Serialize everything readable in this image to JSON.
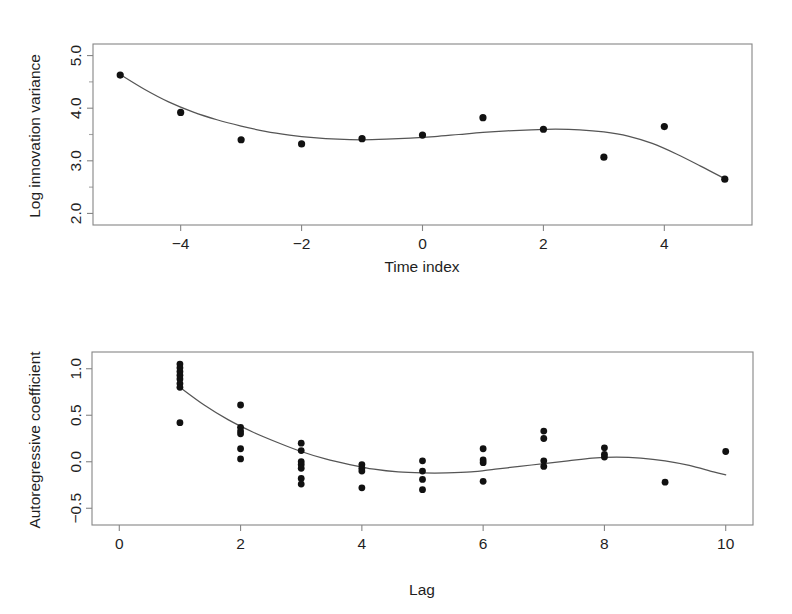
{
  "figure": {
    "background": "#ffffff",
    "point_color": "#111111",
    "line_color": "#555555",
    "frame_color": "#868686"
  },
  "chart_data": [
    {
      "type": "scatter",
      "panel": "top",
      "title": "",
      "xlabel": "Time index",
      "ylabel": "Log innovation variance",
      "xlim": [
        -5.45,
        5.45
      ],
      "ylim": [
        1.78,
        5.22
      ],
      "xticks": [
        -4,
        -2,
        0,
        2,
        4
      ],
      "xticklabels": [
        "−4",
        "−2",
        "0",
        "2",
        "4"
      ],
      "yticks": [
        2.0,
        3.0,
        4.0,
        5.0
      ],
      "yticklabels": [
        "2.0",
        "3.0",
        "4.0",
        "5.0"
      ],
      "minor_yticks": [
        2.5,
        3.5,
        4.5
      ],
      "grid": false,
      "legend": "none",
      "x": [
        -5,
        -4,
        -3,
        -2,
        -1,
        0,
        1,
        2,
        3,
        4,
        5
      ],
      "y": [
        4.63,
        3.92,
        3.4,
        3.32,
        3.42,
        3.49,
        3.82,
        3.6,
        3.07,
        3.65,
        2.65
      ],
      "series": [
        {
          "name": "Log innovation variance",
          "marker": "filled-circle",
          "values": [
            4.63,
            3.92,
            3.4,
            3.32,
            3.42,
            3.49,
            3.82,
            3.6,
            3.07,
            3.65,
            2.65
          ]
        }
      ],
      "fit_curve": {
        "name": "smoothed fit",
        "x": [
          -5.0,
          -4.6,
          -4.2,
          -3.8,
          -3.4,
          -3.0,
          -2.6,
          -2.2,
          -1.8,
          -1.4,
          -1.0,
          -0.6,
          -0.2,
          0.2,
          0.6,
          1.0,
          1.4,
          1.8,
          2.2,
          2.6,
          3.0,
          3.4,
          3.8,
          4.2,
          4.6,
          5.0
        ],
        "y": [
          4.64,
          4.36,
          4.12,
          3.93,
          3.78,
          3.66,
          3.56,
          3.49,
          3.44,
          3.41,
          3.4,
          3.41,
          3.43,
          3.46,
          3.5,
          3.54,
          3.57,
          3.59,
          3.6,
          3.59,
          3.55,
          3.47,
          3.33,
          3.13,
          2.9,
          2.66
        ]
      }
    },
    {
      "type": "scatter",
      "panel": "bottom",
      "title": "",
      "xlabel": "Lag",
      "ylabel": "Autoregressive coefficient",
      "xlim": [
        -0.45,
        10.45
      ],
      "ylim": [
        -0.68,
        1.18
      ],
      "xticks": [
        0,
        2,
        4,
        6,
        8,
        10
      ],
      "xticklabels": [
        "0",
        "2",
        "4",
        "6",
        "8",
        "10"
      ],
      "yticks": [
        -0.5,
        0.0,
        0.5,
        1.0
      ],
      "yticklabels": [
        "−0.5",
        "0.0",
        "0.5",
        "1.0"
      ],
      "grid": false,
      "legend": "none",
      "points": [
        {
          "x": 1,
          "y": 1.05
        },
        {
          "x": 1,
          "y": 1.01
        },
        {
          "x": 1,
          "y": 0.97
        },
        {
          "x": 1,
          "y": 0.93
        },
        {
          "x": 1,
          "y": 0.89
        },
        {
          "x": 1,
          "y": 0.84
        },
        {
          "x": 1,
          "y": 0.8
        },
        {
          "x": 1,
          "y": 0.42
        },
        {
          "x": 2,
          "y": 0.61
        },
        {
          "x": 2,
          "y": 0.37
        },
        {
          "x": 2,
          "y": 0.33
        },
        {
          "x": 2,
          "y": 0.3
        },
        {
          "x": 2,
          "y": 0.14
        },
        {
          "x": 2,
          "y": 0.03
        },
        {
          "x": 3,
          "y": 0.2
        },
        {
          "x": 3,
          "y": 0.12
        },
        {
          "x": 3,
          "y": 0.0
        },
        {
          "x": 3,
          "y": -0.03
        },
        {
          "x": 3,
          "y": -0.07
        },
        {
          "x": 3,
          "y": -0.18
        },
        {
          "x": 3,
          "y": -0.24
        },
        {
          "x": 4,
          "y": -0.03
        },
        {
          "x": 4,
          "y": -0.07
        },
        {
          "x": 4,
          "y": -0.1
        },
        {
          "x": 4,
          "y": -0.28
        },
        {
          "x": 5,
          "y": 0.01
        },
        {
          "x": 5,
          "y": -0.1
        },
        {
          "x": 5,
          "y": -0.19
        },
        {
          "x": 5,
          "y": -0.3
        },
        {
          "x": 6,
          "y": 0.14
        },
        {
          "x": 6,
          "y": 0.02
        },
        {
          "x": 6,
          "y": -0.01
        },
        {
          "x": 6,
          "y": -0.21
        },
        {
          "x": 7,
          "y": 0.33
        },
        {
          "x": 7,
          "y": 0.25
        },
        {
          "x": 7,
          "y": 0.01
        },
        {
          "x": 7,
          "y": -0.05
        },
        {
          "x": 8,
          "y": 0.15
        },
        {
          "x": 8,
          "y": 0.08
        },
        {
          "x": 8,
          "y": 0.05
        },
        {
          "x": 9,
          "y": -0.22
        },
        {
          "x": 10,
          "y": 0.11
        }
      ],
      "fit_curve": {
        "name": "smoothed fit",
        "x": [
          1.0,
          1.4,
          1.8,
          2.2,
          2.6,
          3.0,
          3.4,
          3.8,
          4.2,
          4.6,
          5.0,
          5.4,
          5.8,
          6.2,
          6.6,
          7.0,
          7.4,
          7.8,
          8.2,
          8.6,
          9.0,
          9.4,
          9.8,
          10.0
        ],
        "y": [
          0.8,
          0.61,
          0.45,
          0.32,
          0.21,
          0.11,
          0.03,
          -0.03,
          -0.08,
          -0.11,
          -0.12,
          -0.12,
          -0.11,
          -0.08,
          -0.05,
          -0.02,
          0.01,
          0.04,
          0.05,
          0.04,
          0.01,
          -0.04,
          -0.11,
          -0.14
        ]
      }
    }
  ]
}
